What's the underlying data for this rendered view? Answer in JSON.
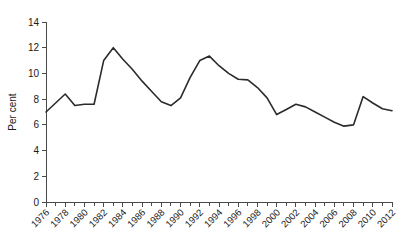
{
  "chart_data": {
    "type": "line",
    "title": "",
    "subtitle": "",
    "xlabel": "",
    "ylabel": "Per cent",
    "xlim": [
      1976,
      2012
    ],
    "ylim": [
      0,
      14
    ],
    "grid": false,
    "legend": false,
    "legend_position": "none",
    "line_color": "#2b2b2b",
    "axis_color": "#4a4a4a",
    "background_color": "#ffffff",
    "ytick_labels": [
      "0",
      "2",
      "4",
      "6",
      "8",
      "10",
      "12",
      "14"
    ],
    "ytick_values": [
      0,
      2,
      4,
      6,
      8,
      10,
      12,
      14
    ],
    "xtick_labels": [
      "1976",
      "1978",
      "1980",
      "1982",
      "1984",
      "1986",
      "1988",
      "1990",
      "1992",
      "1994",
      "1996",
      "1998",
      "2000",
      "2002",
      "2004",
      "2006",
      "2008",
      "2010",
      "2012"
    ],
    "xtick_values": [
      1976,
      1978,
      1980,
      1982,
      1984,
      1986,
      1988,
      1990,
      1992,
      1994,
      1996,
      1998,
      2000,
      2002,
      2004,
      2006,
      2008,
      2010,
      2012
    ],
    "xtick_label_rotation": 45,
    "minor_xticks_every": 1,
    "x": [
      1976,
      1977,
      1978,
      1979,
      1980,
      1981,
      1982,
      1983,
      1984,
      1985,
      1986,
      1987,
      1988,
      1989,
      1990,
      1991,
      1992,
      1993,
      1994,
      1995,
      1996,
      1997,
      1998,
      1999,
      2000,
      2001,
      2002,
      2003,
      2004,
      2005,
      2006,
      2007,
      2008,
      2009,
      2010,
      2011,
      2012
    ],
    "values": [
      7.0,
      7.7,
      8.4,
      7.5,
      7.6,
      7.6,
      11.0,
      12.0,
      11.1,
      10.3,
      9.4,
      8.6,
      7.8,
      7.5,
      8.1,
      9.7,
      11.0,
      11.35,
      10.6,
      10.0,
      9.55,
      9.5,
      8.9,
      8.1,
      6.8,
      7.2,
      7.6,
      7.4,
      7.0,
      6.6,
      6.2,
      5.9,
      6.0,
      8.2,
      7.7,
      7.25,
      7.1
    ],
    "series": [
      {
        "name": "Per cent",
        "values": [
          7.0,
          7.7,
          8.4,
          7.5,
          7.6,
          7.6,
          11.0,
          12.0,
          11.1,
          10.3,
          9.4,
          8.6,
          7.8,
          7.5,
          8.1,
          9.7,
          11.0,
          11.35,
          10.6,
          10.0,
          9.55,
          9.5,
          8.9,
          8.1,
          6.8,
          7.2,
          7.6,
          7.4,
          7.0,
          6.6,
          6.2,
          5.9,
          6.0,
          8.2,
          7.7,
          7.25,
          7.1
        ]
      }
    ]
  }
}
